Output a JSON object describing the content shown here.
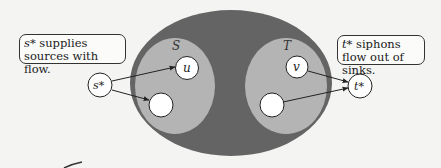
{
  "diagram": {
    "colors": {
      "background": "#f4f4f3",
      "outer": "#646464",
      "inner": "#b4b4b4",
      "node": "#ffffff",
      "stroke": "#222222"
    },
    "regions": [
      {
        "id": "outer",
        "label": ""
      },
      {
        "id": "S",
        "label": "S"
      },
      {
        "id": "T",
        "label": "T"
      }
    ],
    "nodes": [
      {
        "id": "s_star",
        "label": "s*"
      },
      {
        "id": "u",
        "label": "u"
      },
      {
        "id": "s_unlabeled",
        "label": ""
      },
      {
        "id": "v",
        "label": "v"
      },
      {
        "id": "t_unlabeled",
        "label": ""
      },
      {
        "id": "t_star",
        "label": "t*"
      }
    ],
    "edges": [
      {
        "from": "s*",
        "to": "u"
      },
      {
        "from": "s*",
        "to": "S-unlabeled"
      },
      {
        "from": "v",
        "to": "t*"
      },
      {
        "from": "T-unlabeled",
        "to": "t*"
      }
    ],
    "callouts": {
      "left": {
        "var": "s*",
        "text": " supplies sources with flow."
      },
      "right": {
        "var": "t*",
        "text": " siphons flow out of sinks."
      }
    }
  }
}
